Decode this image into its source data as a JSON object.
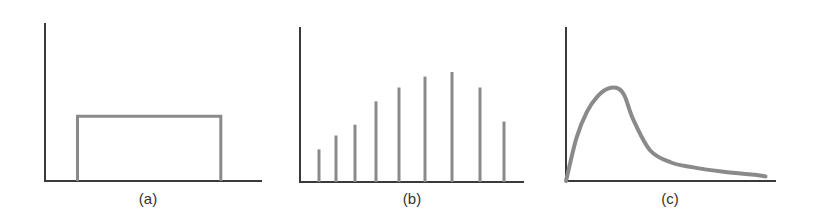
{
  "colors": {
    "axis": "#3a3a3a",
    "series": "#8a8a8a",
    "background": "#ffffff"
  },
  "panels": [
    {
      "label": "(a)"
    },
    {
      "label": "(b)"
    },
    {
      "label": "(c)"
    }
  ],
  "chart_data": [
    {
      "type": "line",
      "title": "(a)",
      "description": "Rectangular (uniform) pulse: flat value over a bounded interval, zero elsewhere",
      "xlabel": "",
      "ylabel": "",
      "x": [
        0.15,
        0.15,
        0.81,
        0.81
      ],
      "values": [
        0,
        0.41,
        0.41,
        0
      ],
      "xlim": [
        0,
        1
      ],
      "ylim": [
        0,
        1
      ],
      "grid": false,
      "legend": null
    },
    {
      "type": "bar",
      "title": "(b)",
      "description": "Discrete stem/line spectrum rising then falling",
      "xlabel": "",
      "ylabel": "",
      "categories": [
        1,
        2,
        3,
        4,
        5,
        6,
        7,
        8,
        9
      ],
      "values": [
        0.21,
        0.3,
        0.37,
        0.52,
        0.61,
        0.68,
        0.71,
        0.61,
        0.39
      ],
      "ylim": [
        0,
        1
      ],
      "grid": false,
      "legend": null
    },
    {
      "type": "line",
      "title": "(c)",
      "description": "Skewed continuous distribution: steep rise to a peak then long decaying tail",
      "xlabel": "",
      "ylabel": "",
      "x": [
        0.0,
        0.05,
        0.1,
        0.15,
        0.2,
        0.25,
        0.28,
        0.32,
        0.4,
        0.5,
        0.6,
        0.75,
        0.9,
        0.95
      ],
      "values": [
        0.0,
        0.28,
        0.45,
        0.55,
        0.6,
        0.6,
        0.55,
        0.4,
        0.2,
        0.12,
        0.09,
        0.06,
        0.04,
        0.03
      ],
      "xlim": [
        0,
        1
      ],
      "ylim": [
        0,
        1
      ],
      "grid": false,
      "legend": null
    }
  ]
}
